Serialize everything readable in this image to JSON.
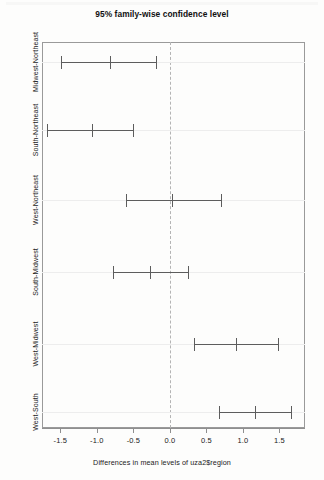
{
  "chart_data": {
    "type": "scatter",
    "plot_kind": "tukey-hsd-confidence-intervals",
    "title": "95% family-wise confidence level",
    "xlabel": "Differences in mean levels of uza2$region",
    "ylabel": "",
    "xlim": [
      -1.75,
      1.85
    ],
    "xticks": [
      -1.5,
      -1.0,
      -0.5,
      0.0,
      0.5,
      1.0,
      1.5
    ],
    "xticklabels": [
      "-1.5",
      "-1.0",
      "-0.5",
      "0.0",
      "0.5",
      "1.0",
      "1.5"
    ],
    "grid": false,
    "legend": null,
    "reference_line": 0.0,
    "reference_line_style": "dashed",
    "categories": [
      "Midwest-Northeast",
      "South-Northeast",
      "West-Northeast",
      "South-Midwest",
      "West-Midwest",
      "West-South"
    ],
    "series": [
      {
        "name": "difference in means",
        "values": [
          -0.82,
          -1.07,
          0.03,
          -0.27,
          0.9,
          1.16
        ]
      },
      {
        "name": "lower confidence bound",
        "values": [
          -1.49,
          -1.68,
          -0.6,
          -0.78,
          0.33,
          0.67
        ]
      },
      {
        "name": "upper confidence bound",
        "values": [
          -0.19,
          -0.51,
          0.7,
          0.25,
          1.48,
          1.66
        ]
      }
    ],
    "intervals": [
      {
        "label": "Midwest-Northeast",
        "lower": -1.49,
        "center": -0.82,
        "upper": -0.19
      },
      {
        "label": "South-Northeast",
        "lower": -1.68,
        "center": -1.07,
        "upper": -0.51
      },
      {
        "label": "West-Northeast",
        "lower": -0.6,
        "center": 0.03,
        "upper": 0.7
      },
      {
        "label": "South-Midwest",
        "lower": -0.78,
        "center": -0.27,
        "upper": 0.25
      },
      {
        "label": "West-Midwest",
        "lower": 0.33,
        "center": 0.9,
        "upper": 1.48
      },
      {
        "label": "West-South",
        "lower": 0.67,
        "center": 1.16,
        "upper": 1.66
      }
    ],
    "colors": {
      "line": "#5d5d5d",
      "frame": "#9a9a9a",
      "reference": "#b4b4b4",
      "background": "#fdfdfc",
      "text": "#1b1b1b"
    }
  }
}
